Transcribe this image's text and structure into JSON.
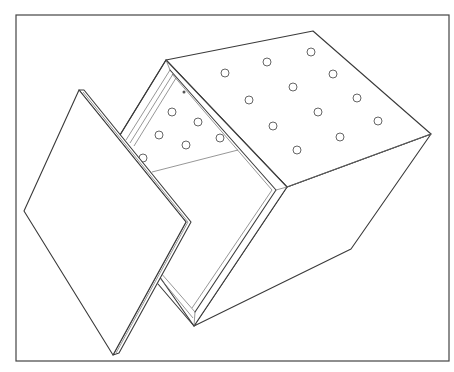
{
  "figure": {
    "caption": "Line drawing of an open box with perforated top face and a detached lid",
    "colors": {
      "stroke": "#3a3a3a",
      "background": "#ffffff",
      "hole_stroke": "#555555"
    },
    "frame": {
      "x": 16,
      "y": 15,
      "width": 433,
      "height": 346
    },
    "box": {
      "top_face_holes": [
        [
          225,
          73
        ],
        [
          267,
          62
        ],
        [
          311,
          52
        ],
        [
          249,
          100
        ],
        [
          293,
          87
        ],
        [
          333,
          74
        ],
        [
          273,
          126
        ],
        [
          318,
          112
        ],
        [
          357,
          98
        ],
        [
          297,
          150
        ],
        [
          340,
          137
        ],
        [
          378,
          121
        ]
      ],
      "inner_holes": [
        [
          172,
          112
        ],
        [
          198,
          122
        ],
        [
          159,
          135
        ],
        [
          186,
          145
        ],
        [
          220,
          138
        ],
        [
          143,
          158
        ]
      ],
      "hole_radius": 4
    },
    "lid": {
      "corners": [
        [
          79,
          90
        ],
        [
          186,
          222
        ],
        [
          113,
          355
        ],
        [
          24,
          211
        ]
      ]
    }
  }
}
